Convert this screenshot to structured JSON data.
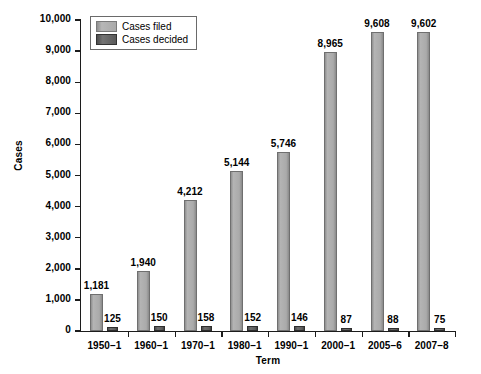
{
  "chart_data": {
    "type": "bar",
    "title": "",
    "xlabel": "Term",
    "ylabel": "Cases",
    "categories": [
      "1950–1",
      "1960–1",
      "1970–1",
      "1980–1",
      "1990–1",
      "2000–1",
      "2005–6",
      "2007–8"
    ],
    "series": [
      {
        "name": "Cases filed",
        "color": "#a9a9a9",
        "values": [
          1181,
          1940,
          4212,
          5144,
          5746,
          8965,
          9608,
          9602
        ],
        "labels": [
          "1,181",
          "1,940",
          "4,212",
          "5,144",
          "5,746",
          "8,965",
          "9,608",
          "9,602"
        ]
      },
      {
        "name": "Cases decided",
        "color": "#5a5a5a",
        "values": [
          125,
          150,
          158,
          152,
          146,
          87,
          88,
          75
        ],
        "labels": [
          "125",
          "150",
          "158",
          "152",
          "146",
          "87",
          "88",
          "75"
        ]
      }
    ],
    "ylim": [
      0,
      10000
    ],
    "ytick_values": [
      0,
      1000,
      2000,
      3000,
      4000,
      5000,
      6000,
      7000,
      8000,
      9000,
      10000
    ],
    "ytick_labels": [
      "0",
      "1,000",
      "2,000",
      "3,000",
      "4,000",
      "5,000",
      "6,000",
      "7,000",
      "8,000",
      "9,000",
      "10,000"
    ],
    "grid": false,
    "legend_position": "top-left"
  },
  "legend": {
    "items": [
      {
        "label": "Cases filed"
      },
      {
        "label": "Cases decided"
      }
    ]
  }
}
